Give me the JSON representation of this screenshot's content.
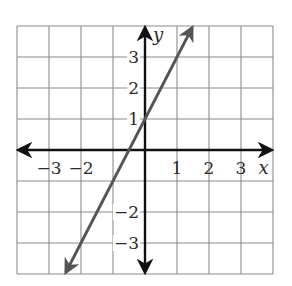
{
  "chart_data": {
    "type": "line",
    "title": "",
    "xlabel": "x",
    "ylabel": "y",
    "xlim": [
      -4,
      4
    ],
    "ylim": [
      -4,
      4
    ],
    "grid": true,
    "legend": null,
    "x_ticks": [
      -3,
      -2,
      1,
      2,
      3
    ],
    "x_tick_labels": [
      "−3",
      "−2",
      "1",
      "2",
      "3"
    ],
    "y_ticks": [
      3,
      2,
      1,
      -2,
      -3
    ],
    "y_tick_labels": [
      "3",
      "2",
      "1",
      "−2",
      "−3"
    ],
    "series": [
      {
        "name": "y = 2x + 1",
        "equation": "y = 2x + 1",
        "slope": 2,
        "intercept": 1,
        "x": [
          -2.47,
          1.47
        ],
        "y": [
          -3.94,
          3.94
        ],
        "arrows_both_ends": true,
        "color": "#555555"
      }
    ]
  },
  "colors": {
    "grid": "#8a8a8a",
    "axes": "#111111",
    "line": "#555555",
    "text": "#2a2a2a"
  }
}
